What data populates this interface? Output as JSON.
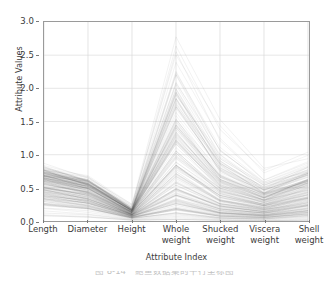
{
  "figure": {
    "caption": "图 8-14　鲍鱼数据集的平行坐标图",
    "background_color": "#ffffff",
    "frame_color": "#9a9a9a",
    "line_color": "#4a4a4a",
    "grid_color": "#d8d8d8"
  },
  "chart_data": {
    "type": "line",
    "subtype": "parallel-coordinates",
    "title": "",
    "subtitle": "",
    "xlabel": "Attribute Index",
    "ylabel": "Attribute Values",
    "categories": [
      "Length",
      "Diameter",
      "Height",
      "Whole\nweight",
      "Shucked\nweight",
      "Viscera\nweight",
      "Shell\nweight"
    ],
    "axis_order": [
      "Length",
      "Diameter",
      "Height",
      "Whole weight",
      "Shucked weight",
      "Viscera weight",
      "Shell weight"
    ],
    "ylim": [
      0.0,
      3.0
    ],
    "yticks": [
      0.0,
      0.5,
      1.0,
      1.5,
      2.0,
      2.5,
      3.0
    ],
    "ytick_labels": [
      "0.0",
      "0.5",
      "1.0",
      "1.5",
      "2.0",
      "2.5",
      "3.0"
    ],
    "xlim": [
      0,
      6
    ],
    "xticks": [
      0,
      1,
      2,
      3,
      4,
      5,
      6
    ],
    "grid": true,
    "legend": "none",
    "legend_position": "none",
    "series_count": 180,
    "line_opacity": 0.16,
    "line_width": 0.45,
    "axis_ranges": {
      "Length": [
        0.07,
        0.82
      ],
      "Diameter": [
        0.05,
        0.65
      ],
      "Height": [
        0.0,
        0.26
      ],
      "Whole weight": [
        0.02,
        2.83
      ],
      "Shucked weight": [
        0.01,
        1.49
      ],
      "Viscera weight": [
        0.0,
        0.76
      ],
      "Shell weight": [
        0.01,
        1.01
      ]
    },
    "annotations": [
      "Dense low band spans 0.0-0.8 across Length, Diameter and Height",
      "Sharp single peak at Whole weight reaching about 2.8",
      "Lines converge near 0.0-0.25 at the Height axis",
      "Values rise again slightly at the Shell weight axis"
    ],
    "series": [
      {
        "name": "obs-1",
        "values": [
          0.82,
          0.65,
          0.26,
          2.83,
          1.49,
          0.76,
          1.01
        ]
      },
      {
        "name": "obs-2",
        "values": [
          0.79,
          0.63,
          0.22,
          2.52,
          1.22,
          0.62,
          0.88
        ]
      },
      {
        "name": "obs-3",
        "values": [
          0.78,
          0.62,
          0.2,
          2.28,
          1.07,
          0.58,
          0.82
        ]
      },
      {
        "name": "obs-4",
        "values": [
          0.77,
          0.61,
          0.19,
          2.18,
          1.02,
          0.56,
          0.8
        ]
      },
      {
        "name": "obs-5",
        "values": [
          0.76,
          0.61,
          0.19,
          2.05,
          0.95,
          0.52,
          0.77
        ]
      },
      {
        "name": "obs-6",
        "values": [
          0.76,
          0.6,
          0.18,
          1.97,
          0.9,
          0.5,
          0.75
        ]
      },
      {
        "name": "obs-7",
        "values": [
          0.75,
          0.6,
          0.18,
          1.9,
          0.86,
          0.48,
          0.73
        ]
      },
      {
        "name": "obs-8",
        "values": [
          0.75,
          0.59,
          0.17,
          1.82,
          0.82,
          0.46,
          0.72
        ]
      },
      {
        "name": "obs-9",
        "values": [
          0.74,
          0.59,
          0.17,
          1.75,
          0.79,
          0.45,
          0.7
        ]
      },
      {
        "name": "obs-10",
        "values": [
          0.74,
          0.58,
          0.17,
          1.68,
          0.76,
          0.43,
          0.69
        ]
      },
      {
        "name": "obs-11",
        "values": [
          0.73,
          0.58,
          0.16,
          1.62,
          0.73,
          0.42,
          0.67
        ]
      },
      {
        "name": "obs-12",
        "values": [
          0.73,
          0.57,
          0.16,
          1.55,
          0.7,
          0.4,
          0.66
        ]
      },
      {
        "name": "obs-13",
        "values": [
          0.72,
          0.57,
          0.16,
          1.48,
          0.67,
          0.39,
          0.64
        ]
      },
      {
        "name": "obs-14",
        "values": [
          0.71,
          0.56,
          0.15,
          1.42,
          0.64,
          0.37,
          0.62
        ]
      },
      {
        "name": "obs-15",
        "values": [
          0.7,
          0.55,
          0.15,
          1.35,
          0.61,
          0.36,
          0.6
        ]
      },
      {
        "name": "obs-16",
        "values": [
          0.69,
          0.54,
          0.15,
          1.28,
          0.58,
          0.34,
          0.58
        ]
      },
      {
        "name": "obs-17",
        "values": [
          0.68,
          0.53,
          0.14,
          1.21,
          0.55,
          0.33,
          0.56
        ]
      },
      {
        "name": "obs-18",
        "values": [
          0.67,
          0.52,
          0.14,
          1.15,
          0.52,
          0.31,
          0.54
        ]
      },
      {
        "name": "obs-19",
        "values": [
          0.66,
          0.51,
          0.14,
          1.09,
          0.49,
          0.3,
          0.52
        ]
      },
      {
        "name": "obs-20",
        "values": [
          0.65,
          0.5,
          0.13,
          1.03,
          0.46,
          0.28,
          0.5
        ]
      },
      {
        "name": "obs-21",
        "values": [
          0.63,
          0.49,
          0.13,
          0.97,
          0.44,
          0.27,
          0.48
        ]
      },
      {
        "name": "obs-22",
        "values": [
          0.62,
          0.48,
          0.13,
          0.92,
          0.41,
          0.26,
          0.46
        ]
      },
      {
        "name": "obs-23",
        "values": [
          0.61,
          0.47,
          0.12,
          0.87,
          0.39,
          0.24,
          0.44
        ]
      },
      {
        "name": "obs-24",
        "values": [
          0.6,
          0.46,
          0.12,
          0.82,
          0.37,
          0.23,
          0.42
        ]
      },
      {
        "name": "obs-25",
        "values": [
          0.58,
          0.45,
          0.12,
          0.77,
          0.35,
          0.22,
          0.4
        ]
      },
      {
        "name": "obs-26",
        "values": [
          0.57,
          0.44,
          0.11,
          0.72,
          0.33,
          0.21,
          0.38
        ]
      },
      {
        "name": "obs-27",
        "values": [
          0.56,
          0.43,
          0.11,
          0.68,
          0.31,
          0.2,
          0.36
        ]
      },
      {
        "name": "obs-28",
        "values": [
          0.54,
          0.42,
          0.11,
          0.64,
          0.29,
          0.19,
          0.35
        ]
      },
      {
        "name": "obs-29",
        "values": [
          0.53,
          0.41,
          0.1,
          0.6,
          0.27,
          0.18,
          0.33
        ]
      },
      {
        "name": "obs-30",
        "values": [
          0.52,
          0.4,
          0.1,
          0.56,
          0.25,
          0.17,
          0.31
        ]
      },
      {
        "name": "obs-31",
        "values": [
          0.5,
          0.38,
          0.1,
          0.52,
          0.23,
          0.16,
          0.29
        ]
      },
      {
        "name": "obs-32",
        "values": [
          0.49,
          0.37,
          0.09,
          0.48,
          0.21,
          0.15,
          0.28
        ]
      },
      {
        "name": "obs-33",
        "values": [
          0.47,
          0.36,
          0.09,
          0.45,
          0.2,
          0.14,
          0.26
        ]
      },
      {
        "name": "obs-34",
        "values": [
          0.46,
          0.35,
          0.09,
          0.41,
          0.18,
          0.13,
          0.24
        ]
      },
      {
        "name": "obs-35",
        "values": [
          0.44,
          0.33,
          0.08,
          0.38,
          0.17,
          0.12,
          0.22
        ]
      },
      {
        "name": "obs-36",
        "values": [
          0.42,
          0.32,
          0.08,
          0.34,
          0.15,
          0.11,
          0.21
        ]
      },
      {
        "name": "obs-37",
        "values": [
          0.41,
          0.31,
          0.08,
          0.31,
          0.14,
          0.1,
          0.19
        ]
      },
      {
        "name": "obs-38",
        "values": [
          0.39,
          0.29,
          0.07,
          0.28,
          0.12,
          0.09,
          0.17
        ]
      },
      {
        "name": "obs-39",
        "values": [
          0.37,
          0.28,
          0.07,
          0.25,
          0.11,
          0.08,
          0.16
        ]
      },
      {
        "name": "obs-40",
        "values": [
          0.35,
          0.26,
          0.07,
          0.22,
          0.1,
          0.07,
          0.14
        ]
      },
      {
        "name": "obs-41",
        "values": [
          0.33,
          0.25,
          0.06,
          0.19,
          0.08,
          0.06,
          0.12
        ]
      },
      {
        "name": "obs-42",
        "values": [
          0.31,
          0.23,
          0.06,
          0.17,
          0.07,
          0.05,
          0.11
        ]
      },
      {
        "name": "obs-43",
        "values": [
          0.29,
          0.21,
          0.05,
          0.14,
          0.06,
          0.04,
          0.09
        ]
      },
      {
        "name": "obs-44",
        "values": [
          0.26,
          0.19,
          0.05,
          0.11,
          0.05,
          0.04,
          0.07
        ]
      },
      {
        "name": "obs-45",
        "values": [
          0.23,
          0.17,
          0.04,
          0.09,
          0.04,
          0.03,
          0.06
        ]
      },
      {
        "name": "obs-46",
        "values": [
          0.2,
          0.15,
          0.04,
          0.07,
          0.03,
          0.02,
          0.04
        ]
      },
      {
        "name": "obs-47",
        "values": [
          0.16,
          0.12,
          0.03,
          0.05,
          0.02,
          0.01,
          0.03
        ]
      },
      {
        "name": "obs-48",
        "values": [
          0.12,
          0.09,
          0.02,
          0.03,
          0.01,
          0.01,
          0.02
        ]
      },
      {
        "name": "obs-49",
        "values": [
          0.09,
          0.06,
          0.01,
          0.02,
          0.01,
          0.0,
          0.01
        ]
      },
      {
        "name": "obs-50",
        "values": [
          0.07,
          0.05,
          0.01,
          0.02,
          0.01,
          0.0,
          0.01
        ]
      }
    ]
  }
}
